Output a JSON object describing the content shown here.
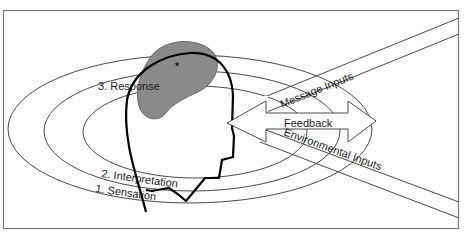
{
  "diagram": {
    "levels": [
      {
        "id": "sensation",
        "label": "1. Sensation"
      },
      {
        "id": "interpretation",
        "label": "2. Interpretation"
      },
      {
        "id": "response",
        "label": "3. Response"
      }
    ],
    "inputs": {
      "message": "Message Inputs",
      "environmental": "Environmental Inputs",
      "feedback": "Feedback"
    },
    "marker": "*",
    "colors": {
      "frame": "#777777",
      "lines": "#333333",
      "head": "#000000",
      "brain": "#8a8a8a"
    }
  }
}
